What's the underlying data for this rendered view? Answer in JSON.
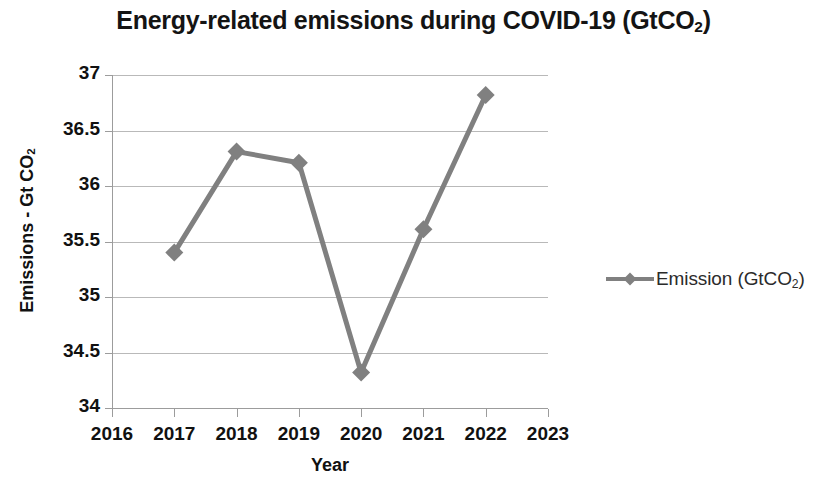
{
  "chart_data": {
    "type": "line",
    "title": "Energy-related emissions during COVID-19 (GtCO2)",
    "title_main": "Energy-related emissions during COVID-19 (GtCO",
    "title_sub": "2",
    "title_tail": ")",
    "xlabel": "Year",
    "ylabel_main": "Emissions - Gt CO",
    "ylabel_sub": "2",
    "ylabel": "Emissions - Gt CO2",
    "x": [
      2017,
      2018,
      2019,
      2020,
      2021,
      2022
    ],
    "categories": [
      "2017",
      "2018",
      "2019",
      "2020",
      "2021",
      "2022"
    ],
    "values": [
      35.4,
      36.31,
      36.21,
      34.32,
      35.61,
      36.82
    ],
    "series": [
      {
        "name": "Emission (GtCO2)",
        "name_main": "Emission (GtCO",
        "name_sub": "2",
        "name_tail": ")",
        "values": [
          35.4,
          36.31,
          36.21,
          34.32,
          35.61,
          36.82
        ],
        "color": "#808080",
        "marker": "diamond"
      }
    ],
    "xlim": [
      2016,
      2023
    ],
    "ylim": [
      34,
      37
    ],
    "x_ticks": [
      "2016",
      "2017",
      "2018",
      "2019",
      "2020",
      "2021",
      "2022",
      "2023"
    ],
    "y_ticks": [
      "34",
      "34.5",
      "35",
      "35.5",
      "36",
      "36.5",
      "37"
    ],
    "grid": "horizontal",
    "legend_position": "right",
    "line_color": "#808080",
    "gridline_color": "#b9b9b9",
    "axis_color": "#9c9c9c",
    "text_color": "#111111",
    "background": "#ffffff"
  }
}
